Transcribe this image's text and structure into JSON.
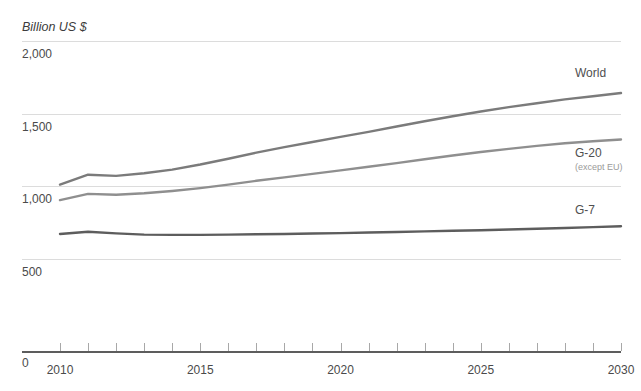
{
  "chart_data": {
    "type": "line",
    "title": "",
    "subtitle": "",
    "xlabel": "",
    "ylabel": "Billion US $",
    "unit_label": "Billion US $",
    "grid": true,
    "legend_position": "right-inline",
    "xlim": [
      2010,
      2030
    ],
    "ylim": [
      0,
      2000
    ],
    "x": [
      2010,
      2011,
      2012,
      2013,
      2014,
      2015,
      2016,
      2017,
      2018,
      2019,
      2020,
      2021,
      2022,
      2023,
      2024,
      2025,
      2026,
      2027,
      2028,
      2029,
      2030
    ],
    "xtick_labels": [
      "2010",
      "2015",
      "2020",
      "2025",
      "2030"
    ],
    "xtick_label_values": [
      2010,
      2015,
      2020,
      2025,
      2030
    ],
    "xtick_minor_values": [
      2010,
      2011,
      2012,
      2013,
      2014,
      2015,
      2016,
      2017,
      2018,
      2019,
      2020,
      2021,
      2022,
      2023,
      2024,
      2025,
      2026,
      2027,
      2028,
      2029,
      2030
    ],
    "ytick_labels": [
      "2,000",
      "1,500",
      "1,000",
      "500",
      "0"
    ],
    "ytick_values": [
      2000,
      1500,
      1000,
      500,
      0
    ],
    "gridline_values": [
      2000,
      1500,
      1000,
      500
    ],
    "zero_label": "0",
    "series": [
      {
        "name": "World",
        "label": "World",
        "sublabel": "",
        "color": "#7b7b7b",
        "values": [
          1012,
          1080,
          1072,
          1090,
          1115,
          1150,
          1190,
          1232,
          1270,
          1305,
          1340,
          1375,
          1412,
          1448,
          1482,
          1515,
          1545,
          1572,
          1598,
          1620,
          1642
        ]
      },
      {
        "name": "G-20 (except EU)",
        "label": "G-20",
        "sublabel": "(except EU)",
        "color": "#8f8f8f",
        "values": [
          905,
          948,
          942,
          952,
          968,
          988,
          1012,
          1038,
          1062,
          1086,
          1110,
          1135,
          1160,
          1186,
          1212,
          1236,
          1258,
          1278,
          1296,
          1310,
          1322
        ]
      },
      {
        "name": "G-7",
        "label": "G-7",
        "sublabel": "",
        "color": "#5d5d5d",
        "values": [
          672,
          688,
          676,
          668,
          666,
          666,
          668,
          670,
          672,
          675,
          678,
          682,
          686,
          690,
          694,
          698,
          703,
          708,
          713,
          719,
          725
        ]
      }
    ],
    "colors": {
      "world": "#7b7b7b",
      "g20": "#8f8f8f",
      "g7": "#5d5d5d",
      "gridline": "#dcdcdc",
      "axis": "#5d5d5d",
      "text": "#4a4a4a",
      "background": "#ffffff"
    }
  }
}
